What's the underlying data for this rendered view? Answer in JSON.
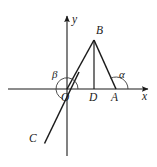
{
  "figure": {
    "kind": "geometry-diagram",
    "background_color": "#ffffff",
    "stroke_color": "#1b1b1b",
    "arc_color": "#3a3a3a",
    "axes": {
      "x_axis_label": "x",
      "y_axis_label": "y",
      "origin_label": "O",
      "x_axis": {
        "x1": 8,
        "y1": 89,
        "x2": 150,
        "y2": 89,
        "arrow": "right"
      },
      "y_axis": {
        "x1": 67,
        "y1": 156,
        "x2": 67,
        "y2": 13,
        "arrow": "up"
      }
    },
    "points": [
      {
        "name": "O",
        "label": "O",
        "x": 67,
        "y": 89,
        "label_x": 61,
        "label_y": 92
      },
      {
        "name": "D",
        "label": "D",
        "x": 94,
        "y": 89,
        "label_x": 89,
        "label_y": 92
      },
      {
        "name": "A",
        "label": "A",
        "x": 116,
        "y": 89,
        "label_x": 111,
        "label_y": 92
      },
      {
        "name": "B",
        "label": "B",
        "x": 94,
        "y": 40,
        "label_x": 96,
        "label_y": 25
      },
      {
        "name": "C",
        "label": "C",
        "x": 45,
        "y": 143,
        "label_x": 30,
        "label_y": 133
      }
    ],
    "segments": [
      {
        "name": "OB",
        "x1": 67,
        "y1": 89,
        "x2": 94,
        "y2": 40
      },
      {
        "name": "BA",
        "x1": 94,
        "y1": 40,
        "x2": 116,
        "y2": 89
      },
      {
        "name": "BD",
        "x1": 94,
        "y1": 40,
        "x2": 94,
        "y2": 89
      },
      {
        "name": "OA",
        "x1": 67,
        "y1": 89,
        "x2": 116,
        "y2": 89
      },
      {
        "name": "line-through-origin-C",
        "x1": 79,
        "y1": 73,
        "x2": 45,
        "y2": 143
      }
    ],
    "angles": [
      {
        "name": "beta",
        "symbol": "β",
        "vertex": "O",
        "label_x": 52,
        "label_y": 71,
        "arc_radius": 11,
        "note": "reflex angle at origin measured from positive x-axis counterclockwise to ray OC"
      },
      {
        "name": "alpha",
        "symbol": "α",
        "vertex": "A",
        "label_x": 119,
        "label_y": 71,
        "arc_radius": 12,
        "note": "angle at A between segment AB and the positive x-axis"
      }
    ]
  }
}
